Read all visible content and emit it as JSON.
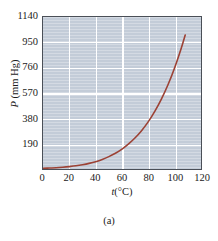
{
  "caption": "(a)",
  "chart_data": {
    "type": "line",
    "title": "",
    "subtitle": "",
    "xlabel": "t(°C)",
    "xlabel_symbol": "t",
    "xlabel_units": "(°C)",
    "ylabel": "P (mm Hg)",
    "ylabel_symbol": "P",
    "ylabel_units": "(mm Hg)",
    "xlim": [
      0,
      120
    ],
    "ylim": [
      0,
      1140
    ],
    "xticks": [
      0,
      20,
      40,
      60,
      80,
      100,
      120
    ],
    "xticklabels": [
      "0",
      "20",
      "40",
      "60",
      "80",
      "100",
      "120"
    ],
    "yticks": [
      190,
      380,
      570,
      760,
      950,
      1140
    ],
    "yticklabels": [
      "190",
      "380",
      "570",
      "760",
      "950",
      "1140"
    ],
    "grid": true,
    "grid_color": "#ffffff",
    "legend": null,
    "legend_position": "none",
    "plot_background": "#c3ccd8",
    "frame_color": "#4a4f57",
    "page_background": "#ffffff",
    "series": [
      {
        "name": "vapor pressure",
        "color": "#9c4235",
        "x": [
          0,
          5,
          10,
          15,
          20,
          25,
          30,
          35,
          40,
          45,
          50,
          55,
          60,
          65,
          70,
          75,
          80,
          85,
          90,
          95,
          100,
          105,
          108
        ],
        "y": [
          5,
          7,
          9,
          13,
          18,
          24,
          32,
          42,
          55,
          72,
          93,
          118,
          149,
          188,
          234,
          289,
          355,
          434,
          526,
          634,
          760,
          906,
          1005
        ]
      }
    ],
    "annotations": []
  }
}
